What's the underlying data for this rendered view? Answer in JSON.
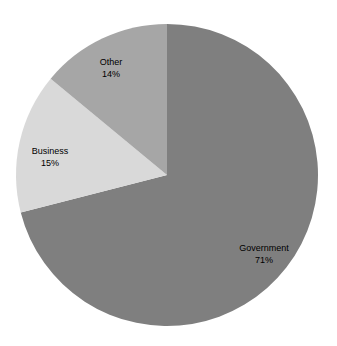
{
  "chart_data": {
    "type": "pie",
    "title": "",
    "categories": [
      "Government",
      "Business",
      "Other"
    ],
    "values": [
      71,
      15,
      14
    ],
    "unit": "%",
    "colors": [
      "#7f7f7f",
      "#d9d9d9",
      "#a6a6a6"
    ],
    "start_angle_deg": 0,
    "direction": "clockwise",
    "legend": "none",
    "data_labels": [
      "Government\n71%",
      "Business\n15%",
      "Other\n14%"
    ]
  },
  "labels": [
    {
      "name": "Government",
      "pct": "71%"
    },
    {
      "name": "Business",
      "pct": "15%"
    },
    {
      "name": "Other",
      "pct": "14%"
    }
  ]
}
